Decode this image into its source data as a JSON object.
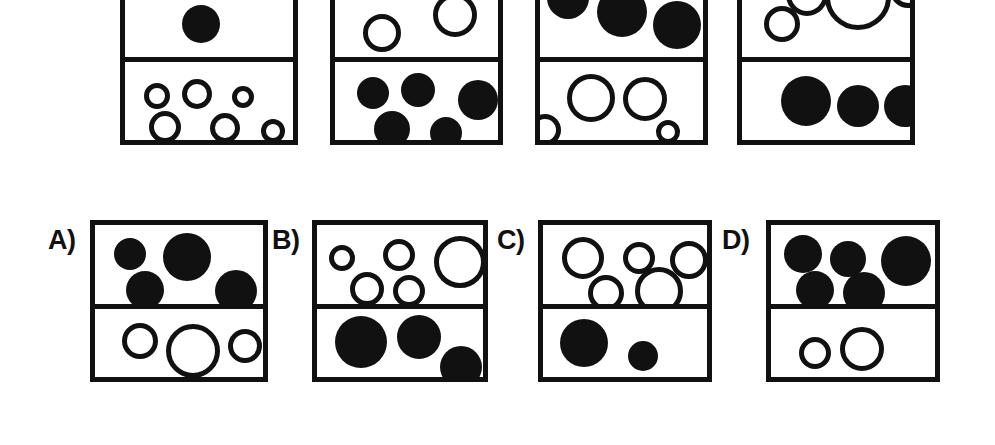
{
  "figure": {
    "title": "",
    "colors": {
      "ink": "#111111",
      "background": "#ffffff"
    },
    "stroke_width_px": 5
  },
  "top_row": {
    "name": "stimulus-row",
    "boxes": [
      {
        "id": "top-box-1",
        "rect": {
          "x": 120,
          "y": -38,
          "w": 178,
          "h": 183
        },
        "divider_y_rel": 95,
        "circles": [
          {
            "compartment": "upper",
            "fill": "solid",
            "cx": 76,
            "cy": 57,
            "r": 19
          },
          {
            "compartment": "lower",
            "fill": "hollow",
            "cx": 32,
            "cy": 129,
            "r": 13
          },
          {
            "compartment": "lower",
            "fill": "hollow",
            "cx": 72,
            "cy": 127,
            "r": 15
          },
          {
            "compartment": "lower",
            "fill": "hollow",
            "cx": 118,
            "cy": 130,
            "r": 11
          },
          {
            "compartment": "lower",
            "fill": "hollow",
            "cx": 40,
            "cy": 160,
            "r": 16
          },
          {
            "compartment": "lower",
            "fill": "hollow",
            "cx": 100,
            "cy": 161,
            "r": 15
          },
          {
            "compartment": "lower",
            "fill": "hollow",
            "cx": 148,
            "cy": 164,
            "r": 12
          }
        ]
      },
      {
        "id": "top-box-2",
        "rect": {
          "x": 330,
          "y": -38,
          "w": 173,
          "h": 183
        },
        "divider_y_rel": 95,
        "circles": [
          {
            "compartment": "upper",
            "fill": "hollow",
            "cx": 47,
            "cy": 66,
            "r": 19
          },
          {
            "compartment": "hollow_upper2",
            "fill": "hollow",
            "cx": 120,
            "cy": 48,
            "r": 22
          },
          {
            "compartment": "lower",
            "fill": "solid",
            "cx": 38,
            "cy": 126,
            "r": 16
          },
          {
            "compartment": "lower",
            "fill": "solid",
            "cx": 83,
            "cy": 123,
            "r": 17
          },
          {
            "compartment": "lower",
            "fill": "solid",
            "cx": 143,
            "cy": 133,
            "r": 20
          },
          {
            "compartment": "lower",
            "fill": "solid",
            "cx": 57,
            "cy": 162,
            "r": 18
          },
          {
            "compartment": "lower",
            "fill": "solid",
            "cx": 111,
            "cy": 166,
            "r": 16
          }
        ]
      },
      {
        "id": "top-box-3",
        "rect": {
          "x": 535,
          "y": -38,
          "w": 173,
          "h": 183
        },
        "divider_y_rel": 95,
        "circles": [
          {
            "compartment": "upper",
            "fill": "solid",
            "cx": 28,
            "cy": 31,
            "r": 21
          },
          {
            "compartment": "upper",
            "fill": "solid",
            "cx": 82,
            "cy": 45,
            "r": 25
          },
          {
            "compartment": "upper",
            "fill": "solid",
            "cx": 137,
            "cy": 58,
            "r": 24
          },
          {
            "compartment": "lower",
            "fill": "hollow",
            "cx": 51,
            "cy": 131,
            "r": 24
          },
          {
            "compartment": "lower",
            "fill": "hollow",
            "cx": 105,
            "cy": 132,
            "r": 22
          },
          {
            "compartment": "lower",
            "fill": "hollow",
            "cx": 5,
            "cy": 163,
            "r": 16
          },
          {
            "compartment": "lower",
            "fill": "hollow",
            "cx": 128,
            "cy": 165,
            "r": 12
          }
        ]
      },
      {
        "id": "top-box-4",
        "rect": {
          "x": 737,
          "y": -38,
          "w": 178,
          "h": 183
        },
        "divider_y_rel": 95,
        "circles": [
          {
            "compartment": "upper",
            "fill": "hollow",
            "cx": 65,
            "cy": 28,
            "r": 21
          },
          {
            "compartment": "upper",
            "fill": "hollow",
            "cx": 116,
            "cy": 30,
            "r": 33
          },
          {
            "compartment": "upper",
            "fill": "hollow",
            "cx": 166,
            "cy": 23,
            "r": 18
          },
          {
            "compartment": "upper",
            "fill": "hollow",
            "cx": 40,
            "cy": 57,
            "r": 18
          },
          {
            "compartment": "lower",
            "fill": "solid",
            "cx": 64,
            "cy": 134,
            "r": 25
          },
          {
            "compartment": "lower",
            "fill": "solid",
            "cx": 116,
            "cy": 139,
            "r": 21
          },
          {
            "compartment": "lower",
            "fill": "solid",
            "cx": 163,
            "cy": 139,
            "r": 21
          }
        ]
      }
    ]
  },
  "options_row": {
    "name": "answer-options-row",
    "options": [
      {
        "id": "option-a",
        "label": "A)",
        "label_pos": {
          "x": 48,
          "y": 227
        },
        "rect": {
          "x": 90,
          "y": 220,
          "w": 178,
          "h": 162
        },
        "divider_y_rel": 84,
        "circles": [
          {
            "compartment": "upper",
            "fill": "solid",
            "cx": 35,
            "cy": 29,
            "r": 16
          },
          {
            "compartment": "upper",
            "fill": "solid",
            "cx": 92,
            "cy": 32,
            "r": 24
          },
          {
            "compartment": "upper",
            "fill": "solid",
            "cx": 50,
            "cy": 65,
            "r": 19
          },
          {
            "compartment": "upper",
            "fill": "solid",
            "cx": 141,
            "cy": 66,
            "r": 21
          },
          {
            "compartment": "lower",
            "fill": "hollow",
            "cx": 45,
            "cy": 116,
            "r": 18
          },
          {
            "compartment": "lower",
            "fill": "hollow",
            "cx": 98,
            "cy": 126,
            "r": 27
          },
          {
            "compartment": "lower",
            "fill": "hollow",
            "cx": 150,
            "cy": 121,
            "r": 17
          }
        ]
      },
      {
        "id": "option-b",
        "label": "B)",
        "label_pos": {
          "x": 272,
          "y": 227
        },
        "rect": {
          "x": 312,
          "y": 220,
          "w": 176,
          "h": 162
        },
        "divider_y_rel": 84,
        "circles": [
          {
            "compartment": "upper",
            "fill": "hollow",
            "cx": 25,
            "cy": 33,
            "r": 13
          },
          {
            "compartment": "upper",
            "fill": "hollow",
            "cx": 82,
            "cy": 30,
            "r": 16
          },
          {
            "compartment": "upper",
            "fill": "hollow",
            "cx": 143,
            "cy": 37,
            "r": 26
          },
          {
            "compartment": "upper",
            "fill": "hollow",
            "cx": 50,
            "cy": 64,
            "r": 17
          },
          {
            "compartment": "upper",
            "fill": "hollow",
            "cx": 92,
            "cy": 66,
            "r": 16
          },
          {
            "compartment": "lower",
            "fill": "solid",
            "cx": 44,
            "cy": 117,
            "r": 26
          },
          {
            "compartment": "lower",
            "fill": "solid",
            "cx": 102,
            "cy": 112,
            "r": 22
          },
          {
            "compartment": "lower",
            "fill": "solid",
            "cx": 144,
            "cy": 142,
            "r": 21
          }
        ]
      },
      {
        "id": "option-c",
        "label": "C)",
        "label_pos": {
          "x": 497,
          "y": 227
        },
        "rect": {
          "x": 538,
          "y": 220,
          "w": 174,
          "h": 162
        },
        "divider_y_rel": 84,
        "circles": [
          {
            "compartment": "upper",
            "fill": "hollow",
            "cx": 40,
            "cy": 33,
            "r": 21
          },
          {
            "compartment": "upper",
            "fill": "hollow",
            "cx": 96,
            "cy": 33,
            "r": 16
          },
          {
            "compartment": "upper",
            "fill": "hollow",
            "cx": 146,
            "cy": 35,
            "r": 19
          },
          {
            "compartment": "upper",
            "fill": "hollow",
            "cx": 63,
            "cy": 68,
            "r": 18
          },
          {
            "compartment": "upper",
            "fill": "hollow",
            "cx": 116,
            "cy": 66,
            "r": 24
          },
          {
            "compartment": "lower",
            "fill": "solid",
            "cx": 41,
            "cy": 118,
            "r": 24
          },
          {
            "compartment": "lower",
            "fill": "solid",
            "cx": 100,
            "cy": 131,
            "r": 15
          }
        ]
      },
      {
        "id": "option-d",
        "label": "D)",
        "label_pos": {
          "x": 722,
          "y": 227
        },
        "rect": {
          "x": 766,
          "y": 220,
          "w": 174,
          "h": 162
        },
        "divider_y_rel": 84,
        "circles": [
          {
            "compartment": "upper",
            "fill": "solid",
            "cx": 32,
            "cy": 29,
            "r": 19
          },
          {
            "compartment": "upper",
            "fill": "solid",
            "cx": 77,
            "cy": 34,
            "r": 18
          },
          {
            "compartment": "upper",
            "fill": "solid",
            "cx": 135,
            "cy": 36,
            "r": 25
          },
          {
            "compartment": "upper",
            "fill": "solid",
            "cx": 44,
            "cy": 65,
            "r": 19
          },
          {
            "compartment": "upper",
            "fill": "solid",
            "cx": 93,
            "cy": 68,
            "r": 21
          },
          {
            "compartment": "lower",
            "fill": "hollow",
            "cx": 44,
            "cy": 128,
            "r": 16
          },
          {
            "compartment": "lower",
            "fill": "hollow",
            "cx": 91,
            "cy": 124,
            "r": 22
          }
        ]
      }
    ]
  }
}
